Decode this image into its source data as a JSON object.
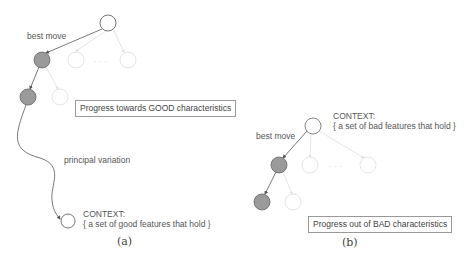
{
  "panel_a": {
    "best_move_label": "best move",
    "progress_box": "Progress towards GOOD characteristics",
    "pv_label": "principal variation",
    "context_title": "CONTEXT:",
    "context_text": "{ a set of good features that hold }",
    "caption": "(a)"
  },
  "panel_b": {
    "best_move_label": "best move",
    "progress_box": "Progress out of BAD characteristics",
    "context_title": "CONTEXT:",
    "context_text": "{ a set of bad features that hold }",
    "caption": "(b)"
  },
  "colors": {
    "active_node_fill": "#9a9a9a",
    "edge": "#555555",
    "faded": "#d8d8d8"
  }
}
